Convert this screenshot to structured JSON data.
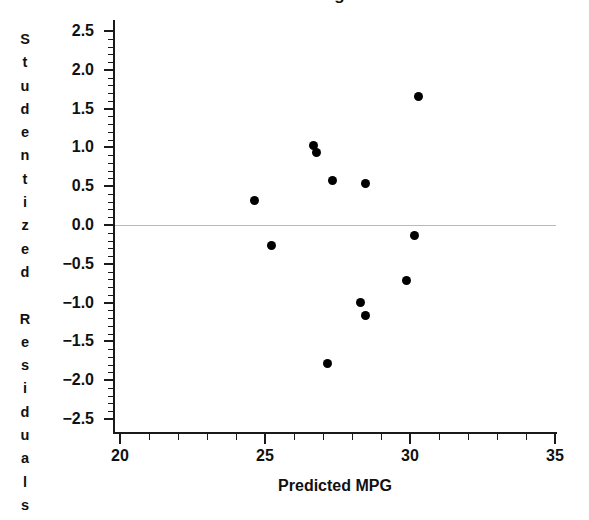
{
  "chart_data": {
    "type": "scatter",
    "title": "Plot of Studentized Residuals against Predicted MPG",
    "xlabel": "Predicted  MPG",
    "ylabel": "Studentized Residuals",
    "xlim": [
      20,
      35
    ],
    "ylim": [
      -2.5,
      2.5
    ],
    "grid": false,
    "legend": null,
    "xticks": [
      20,
      25,
      30,
      35
    ],
    "xtick_labels": [
      "20",
      "25",
      "30",
      "35"
    ],
    "xminor_step": 1,
    "yticks": [
      2.5,
      2.0,
      1.5,
      1.0,
      0.5,
      0.0,
      -0.5,
      -1.0,
      -1.5,
      -2.0,
      -2.5
    ],
    "ytick_labels": [
      "2.5",
      "2.0",
      "1.5",
      "1.0",
      "0.5",
      "0.0",
      "−0.5",
      "−1.0",
      "−1.5",
      "−2.0",
      "−2.5"
    ],
    "yminor_step": 0.1,
    "reference_line": {
      "y": 0.0,
      "color": "#b9b9b9"
    },
    "marker_color": "#000000",
    "points": [
      {
        "x": 24.65,
        "y": 0.32
      },
      {
        "x": 25.24,
        "y": -0.26
      },
      {
        "x": 26.66,
        "y": 1.02
      },
      {
        "x": 26.78,
        "y": 0.93
      },
      {
        "x": 27.17,
        "y": -1.78
      },
      {
        "x": 27.34,
        "y": 0.57
      },
      {
        "x": 28.28,
        "y": -1.0
      },
      {
        "x": 28.45,
        "y": 0.54
      },
      {
        "x": 28.45,
        "y": -1.17
      },
      {
        "x": 29.87,
        "y": -0.72
      },
      {
        "x": 30.17,
        "y": -0.13
      },
      {
        "x": 30.28,
        "y": 1.65
      }
    ]
  },
  "ylabel_chars": [
    "S",
    "t",
    "u",
    "d",
    "e",
    "n",
    "t",
    "i",
    "z",
    "e",
    "d",
    "",
    "R",
    "e",
    "s",
    "i",
    "d",
    "u",
    "a",
    "l",
    "s"
  ]
}
